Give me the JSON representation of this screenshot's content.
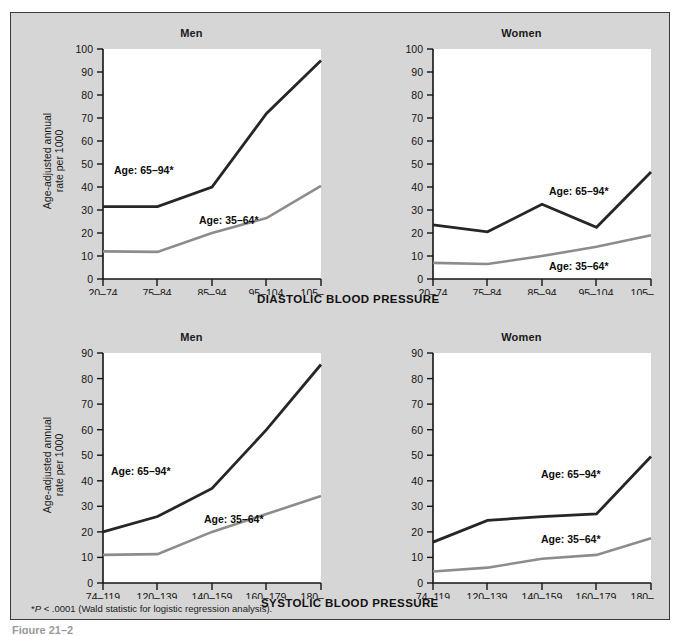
{
  "figure": {
    "background_color": "#d6d6d6",
    "border_color": "#3a3a3a",
    "y_axis_label_line1": "Age-adjusted annual",
    "y_axis_label_line2": "rate per 1000",
    "footnote_marker": "*",
    "footnote_italic": "P",
    "footnote_rest": " < .0001 (Wald statistic for logistic regression analysis).",
    "caption_sliver": "Figure 21–2",
    "series_colors": {
      "older": "#262626",
      "younger": "#8c8c8c"
    }
  },
  "chart_data": [
    {
      "id": "men-diastolic",
      "type": "line",
      "title": "Men",
      "xlabel": "DIASTOLIC BLOOD PRESSURE",
      "ylabel": "Age-adjusted annual rate per 1000",
      "categories": [
        "20–74",
        "75–84",
        "85–94",
        "95–104",
        "105–160"
      ],
      "ylim": [
        0,
        100
      ],
      "yticks": [
        0,
        10,
        20,
        30,
        40,
        50,
        60,
        70,
        80,
        90,
        100
      ],
      "grid": false,
      "legend_position": "inline-annotation",
      "series": [
        {
          "name": "Age: 65–94*",
          "values": [
            31.5,
            31.5,
            40.0,
            72.0,
            95.0
          ],
          "color": "#262626"
        },
        {
          "name": "Age: 35–64*",
          "values": [
            12.0,
            11.8,
            20.0,
            26.5,
            40.5
          ],
          "color": "#8c8c8c"
        }
      ]
    },
    {
      "id": "women-diastolic",
      "type": "line",
      "title": "Women",
      "xlabel": "DIASTOLIC BLOOD PRESSURE",
      "ylabel": "Age-adjusted annual rate per 1000",
      "categories": [
        "20–74",
        "75–84",
        "85–94",
        "95–104",
        "105–160"
      ],
      "ylim": [
        0,
        100
      ],
      "yticks": [
        0,
        10,
        20,
        30,
        40,
        50,
        60,
        70,
        80,
        90,
        100
      ],
      "grid": false,
      "legend_position": "inline-annotation",
      "series": [
        {
          "name": "Age: 65–94*",
          "values": [
            23.5,
            20.5,
            32.5,
            22.5,
            46.5
          ],
          "color": "#262626"
        },
        {
          "name": "Age: 35–64*",
          "values": [
            7.0,
            6.5,
            10.0,
            14.0,
            19.0
          ],
          "color": "#8c8c8c"
        }
      ]
    },
    {
      "id": "men-systolic",
      "type": "line",
      "title": "Men",
      "xlabel": "SYSTOLIC BLOOD PRESSURE",
      "ylabel": "Age-adjusted annual rate per 1000",
      "categories": [
        "74–119",
        "120–139",
        "140–159",
        "160–179",
        "180–300"
      ],
      "ylim": [
        0,
        90
      ],
      "yticks": [
        0,
        10,
        20,
        30,
        40,
        50,
        60,
        70,
        80,
        90
      ],
      "grid": false,
      "legend_position": "inline-annotation",
      "series": [
        {
          "name": "Age: 65–94*",
          "values": [
            20.0,
            26.0,
            37.0,
            60.0,
            85.5
          ],
          "color": "#262626"
        },
        {
          "name": "Age: 35–64*",
          "values": [
            11.0,
            11.3,
            20.0,
            27.0,
            34.0
          ],
          "color": "#8c8c8c"
        }
      ]
    },
    {
      "id": "women-systolic",
      "type": "line",
      "title": "Women",
      "xlabel": "SYSTOLIC BLOOD PRESSURE",
      "ylabel": "Age-adjusted annual rate per 1000",
      "categories": [
        "74–119",
        "120–139",
        "140–159",
        "160–179",
        "180–300"
      ],
      "ylim": [
        0,
        90
      ],
      "yticks": [
        0,
        10,
        20,
        30,
        40,
        50,
        60,
        70,
        80,
        90
      ],
      "grid": false,
      "legend_position": "inline-annotation",
      "series": [
        {
          "name": "Age: 65–94*",
          "values": [
            16.0,
            24.5,
            26.0,
            27.0,
            49.5
          ],
          "color": "#262626"
        },
        {
          "name": "Age: 35–64*",
          "values": [
            4.5,
            6.0,
            9.5,
            11.0,
            17.5
          ],
          "color": "#8c8c8c"
        }
      ]
    }
  ],
  "annotations": {
    "men_diastolic": {
      "older": "Age: 65–94*",
      "younger": "Age: 35–64*"
    },
    "women_diastolic": {
      "older": "Age: 65–94*",
      "younger": "Age: 35–64*"
    },
    "men_systolic": {
      "older": "Age: 65–94*",
      "younger": "Age: 35–64*"
    },
    "women_systolic": {
      "older": "Age: 65–94*",
      "younger": "Age: 35–64*"
    }
  }
}
